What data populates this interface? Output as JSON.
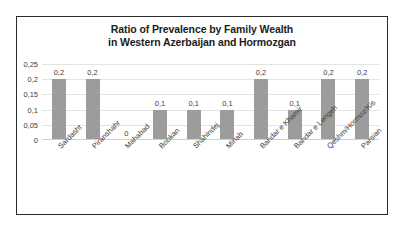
{
  "chart_data": {
    "type": "bar",
    "title": "Ratio of Prevalence by Family Wealth in Western Azerbaijan and Hormozgan",
    "title_lines": [
      "Ratio of Prevalence by Family Wealth",
      "in Western Azerbaijan and Hormozgan"
    ],
    "categories": [
      "Sardasht",
      "Piranshahr",
      "Mahabad",
      "Bookan",
      "Shahindej",
      "Minab",
      "Bandar e Khamir",
      "Bandar e Lengeh",
      "Qeshm/Hormoz/Kis",
      "Parsian"
    ],
    "values": [
      0.2,
      0.2,
      0,
      0.1,
      0.1,
      0.1,
      0.2,
      0.1,
      0.2,
      0.2
    ],
    "data_labels": [
      "0,2",
      "0,2",
      "0",
      "0,1",
      "0,1",
      "0,1",
      "0,2",
      "0,1",
      "0,2",
      "0,2"
    ],
    "xlabel": "",
    "ylabel": "",
    "ylim": [
      0,
      0.25
    ],
    "y_ticks": [
      0,
      0.05,
      0.1,
      0.15,
      0.2,
      0.25
    ],
    "y_tick_labels": [
      "0",
      "0,05",
      "0,1",
      "0,15",
      "0,2",
      "0,25"
    ],
    "decimal_separator": ",",
    "grid": true,
    "legend": false,
    "bar_color": "#9c9c9c",
    "grid_color": "#e3e3e3",
    "text_color": "#3d3d3d",
    "title_color": "#1c1c1c",
    "frame_color": "#2b2b2b",
    "background": "#ffffff"
  }
}
